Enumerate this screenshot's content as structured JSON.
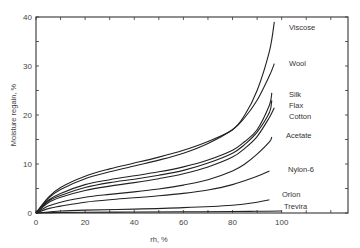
{
  "chart_data": {
    "type": "line",
    "title": "",
    "xlabel": "rh, %",
    "ylabel": "Moisture regain, %",
    "xlim": [
      0,
      127
    ],
    "ylim": [
      0,
      40
    ],
    "x_ticks": [
      0,
      20,
      40,
      60,
      80,
      100
    ],
    "y_ticks": [
      0,
      10,
      20,
      30,
      40
    ],
    "grid": false,
    "legend": "inline labels at curve ends",
    "series": [
      {
        "name": "Viscose",
        "x": [
          0,
          5,
          10,
          20,
          30,
          40,
          50,
          60,
          70,
          80,
          85,
          90,
          95,
          97
        ],
        "y": [
          0,
          3.2,
          5.2,
          7.5,
          9.0,
          10.2,
          11.4,
          12.8,
          14.6,
          17.0,
          20.0,
          25.0,
          33.0,
          39.0
        ]
      },
      {
        "name": "Wool",
        "x": [
          0,
          5,
          10,
          20,
          30,
          40,
          50,
          60,
          70,
          80,
          85,
          90,
          95,
          97
        ],
        "y": [
          0,
          3.0,
          4.8,
          7.0,
          8.4,
          9.6,
          10.8,
          12.2,
          14.2,
          17.0,
          19.5,
          23.0,
          28.0,
          30.5
        ]
      },
      {
        "name": "Silk",
        "x": [
          0,
          5,
          10,
          20,
          30,
          40,
          50,
          60,
          70,
          80,
          85,
          90,
          95,
          96
        ],
        "y": [
          0,
          2.6,
          4.0,
          5.8,
          6.8,
          7.6,
          8.4,
          9.4,
          10.8,
          12.8,
          14.6,
          17.0,
          22.0,
          24.5
        ]
      },
      {
        "name": "Flax",
        "x": [
          0,
          5,
          10,
          20,
          30,
          40,
          50,
          60,
          70,
          80,
          85,
          90,
          95,
          96
        ],
        "y": [
          0,
          2.4,
          3.6,
          5.2,
          6.2,
          6.9,
          7.7,
          8.7,
          10.2,
          12.2,
          14.0,
          16.5,
          20.5,
          23.0
        ]
      },
      {
        "name": "Cotton",
        "x": [
          0,
          5,
          10,
          20,
          30,
          40,
          50,
          60,
          70,
          80,
          85,
          90,
          95,
          97
        ],
        "y": [
          0,
          2.1,
          3.2,
          4.6,
          5.5,
          6.2,
          7.0,
          8.0,
          9.4,
          11.4,
          13.2,
          15.6,
          19.5,
          21.5
        ]
      },
      {
        "name": "Acetate",
        "x": [
          0,
          5,
          10,
          20,
          30,
          40,
          50,
          60,
          70,
          80,
          85,
          90,
          95,
          96
        ],
        "y": [
          0,
          1.4,
          2.2,
          3.2,
          3.8,
          4.3,
          4.9,
          5.7,
          6.8,
          8.6,
          10.0,
          12.0,
          14.5,
          15.5
        ]
      },
      {
        "name": "Nylon-6",
        "x": [
          0,
          5,
          10,
          20,
          30,
          40,
          50,
          60,
          70,
          80,
          90,
          95
        ],
        "y": [
          0,
          0.9,
          1.4,
          2.2,
          2.7,
          3.1,
          3.5,
          4.0,
          4.7,
          5.8,
          7.5,
          8.6
        ]
      },
      {
        "name": "Orlon",
        "x": [
          0,
          10,
          20,
          40,
          60,
          80,
          90,
          95
        ],
        "y": [
          0,
          0.4,
          0.6,
          0.8,
          1.1,
          1.6,
          2.2,
          2.7
        ]
      },
      {
        "name": "Trevira",
        "x": [
          0,
          10,
          20,
          40,
          60,
          80,
          90,
          100
        ],
        "y": [
          0,
          0.1,
          0.15,
          0.2,
          0.25,
          0.3,
          0.35,
          0.4
        ]
      }
    ]
  }
}
